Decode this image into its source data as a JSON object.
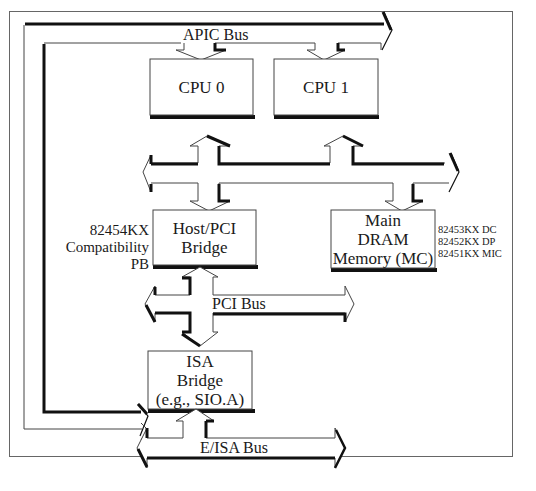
{
  "diagram": {
    "title_cut_off": true,
    "buses": {
      "apic": {
        "label": "APIC Bus"
      },
      "pci": {
        "label": "PCI Bus"
      },
      "eisa": {
        "label": "E/ISA Bus"
      }
    },
    "nodes": {
      "cpu0": {
        "label": "CPU 0"
      },
      "cpu1": {
        "label": "CPU 1"
      },
      "host_pci_bridge": {
        "lines": [
          "Host/PCI",
          "Bridge"
        ]
      },
      "main_dram": {
        "lines": [
          "Main",
          "DRAM",
          "Memory (MC)"
        ]
      },
      "isa_bridge": {
        "lines": [
          "ISA",
          "Bridge",
          "(e.g., SIO.A)"
        ]
      }
    },
    "annotations": {
      "host_bridge_part": {
        "lines": [
          "82454KX",
          "Compatibility",
          "PB"
        ]
      },
      "memory_parts": {
        "lines": [
          "82453KX DC",
          "82452KX DP",
          "82451KX MIC"
        ]
      }
    },
    "colors": {
      "line": "#111111",
      "frame": "#555555",
      "background": "#ffffff",
      "box_fill": "#ffffff"
    }
  }
}
